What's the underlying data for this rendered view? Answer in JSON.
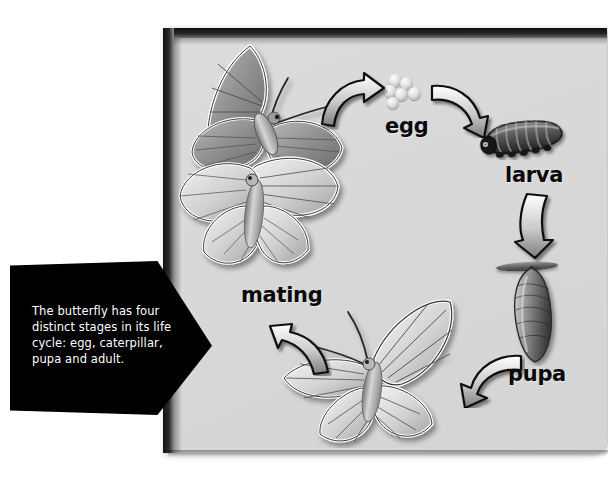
{
  "diagram": {
    "panel_background": "#d8d8d8",
    "labels": {
      "egg": "egg",
      "larva": "larva",
      "pupa": "pupa",
      "mating": "mating"
    },
    "stages": [
      {
        "id": "mating",
        "label": "mating",
        "art": "two-butterflies-mating"
      },
      {
        "id": "egg",
        "label": "egg",
        "art": "egg-cluster"
      },
      {
        "id": "larva",
        "label": "larva",
        "art": "caterpillar"
      },
      {
        "id": "pupa",
        "label": "pupa",
        "art": "chrysalis-on-twig"
      },
      {
        "id": "adult",
        "label": "",
        "art": "adult-butterfly"
      }
    ],
    "arrows": [
      {
        "id": "arrow-mating-to-egg",
        "from": "mating",
        "to": "egg",
        "direction": "up-right"
      },
      {
        "id": "arrow-egg-to-larva",
        "from": "egg",
        "to": "larva",
        "direction": "down-right"
      },
      {
        "id": "arrow-larva-to-pupa",
        "from": "larva",
        "to": "pupa",
        "direction": "down"
      },
      {
        "id": "arrow-pupa-to-adult",
        "from": "pupa",
        "to": "adult",
        "direction": "down-left"
      },
      {
        "id": "arrow-adult-to-mating",
        "from": "adult",
        "to": "mating",
        "direction": "up-left"
      }
    ]
  },
  "callout": {
    "text": "The butterfly has four distinct stages in its life cycle: egg, caterpillar, pupa and adult.",
    "background": "#000000",
    "text_color": "#ffffff"
  }
}
